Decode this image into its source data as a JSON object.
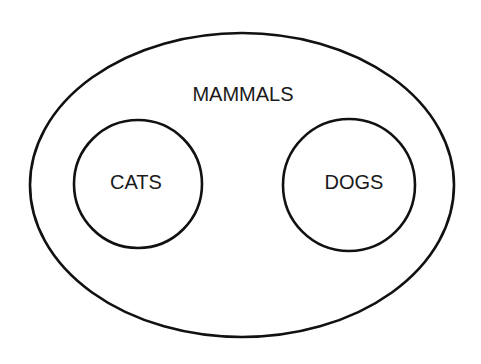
{
  "diagram": {
    "type": "euler",
    "outer": {
      "label": "MAMMALS",
      "cx": 242,
      "cy": 185,
      "rx": 212,
      "ry": 152
    },
    "inner": [
      {
        "label": "CATS",
        "cx": 138,
        "cy": 184,
        "r": 64
      },
      {
        "label": "DOGS",
        "cx": 349,
        "cy": 185,
        "r": 66
      }
    ],
    "colors": {
      "stroke": "#111111",
      "text": "#1a1a1a",
      "background": "#ffffff"
    }
  }
}
